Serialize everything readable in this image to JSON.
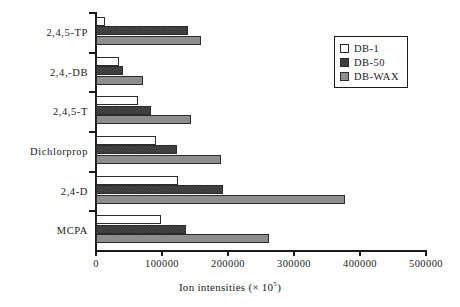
{
  "chart_data": {
    "type": "bar",
    "orientation": "horizontal",
    "title": "",
    "xlabel": "Ion intensities (× 10⁵)",
    "xlabel_parts": {
      "text": "Ion intensities (",
      "mult": "×",
      "base": " 10",
      "exp": "5",
      "close": ")"
    },
    "ylabel": "",
    "categories": [
      "MCPA",
      "2,4-D",
      "Dichlorprop",
      "2,4,5-T",
      "2,4,-DB",
      "2,4,5-TP"
    ],
    "categories_top_to_bottom": [
      "2,4,5-TP",
      "2,4,-DB",
      "2,4,5-T",
      "Dichlorprop",
      "2,4-D",
      "MCPA"
    ],
    "series": [
      {
        "name": "DB-1",
        "color": "#ffffff",
        "pattern": "solid",
        "values": [
          98000,
          124000,
          91000,
          64000,
          35000,
          13000
        ]
      },
      {
        "name": "DB-50",
        "color": "#4c4c4c",
        "pattern": "checkered",
        "values": [
          136000,
          192000,
          123000,
          83000,
          41000,
          139000
        ]
      },
      {
        "name": "DB-WAX",
        "color": "#8e8e8e",
        "pattern": "solid",
        "values": [
          262000,
          378000,
          190000,
          144000,
          71000,
          159000
        ]
      }
    ],
    "xlim": [
      0,
      500000
    ],
    "xticks": [
      0,
      100000,
      200000,
      300000,
      400000,
      500000
    ],
    "xtick_labels": [
      "0",
      "100000",
      "200000",
      "300000",
      "400000",
      "500000"
    ],
    "grid": false,
    "legend": {
      "position": "top-right",
      "entries": [
        "DB-1",
        "DB-50",
        "DB-WAX"
      ]
    }
  },
  "legend": {
    "items": [
      {
        "label": "DB-1",
        "swatch": "db1-swatch"
      },
      {
        "label": "DB-50",
        "swatch": "db50-swatch"
      },
      {
        "label": "DB-WAX",
        "swatch": "dbwax-swatch"
      }
    ]
  }
}
